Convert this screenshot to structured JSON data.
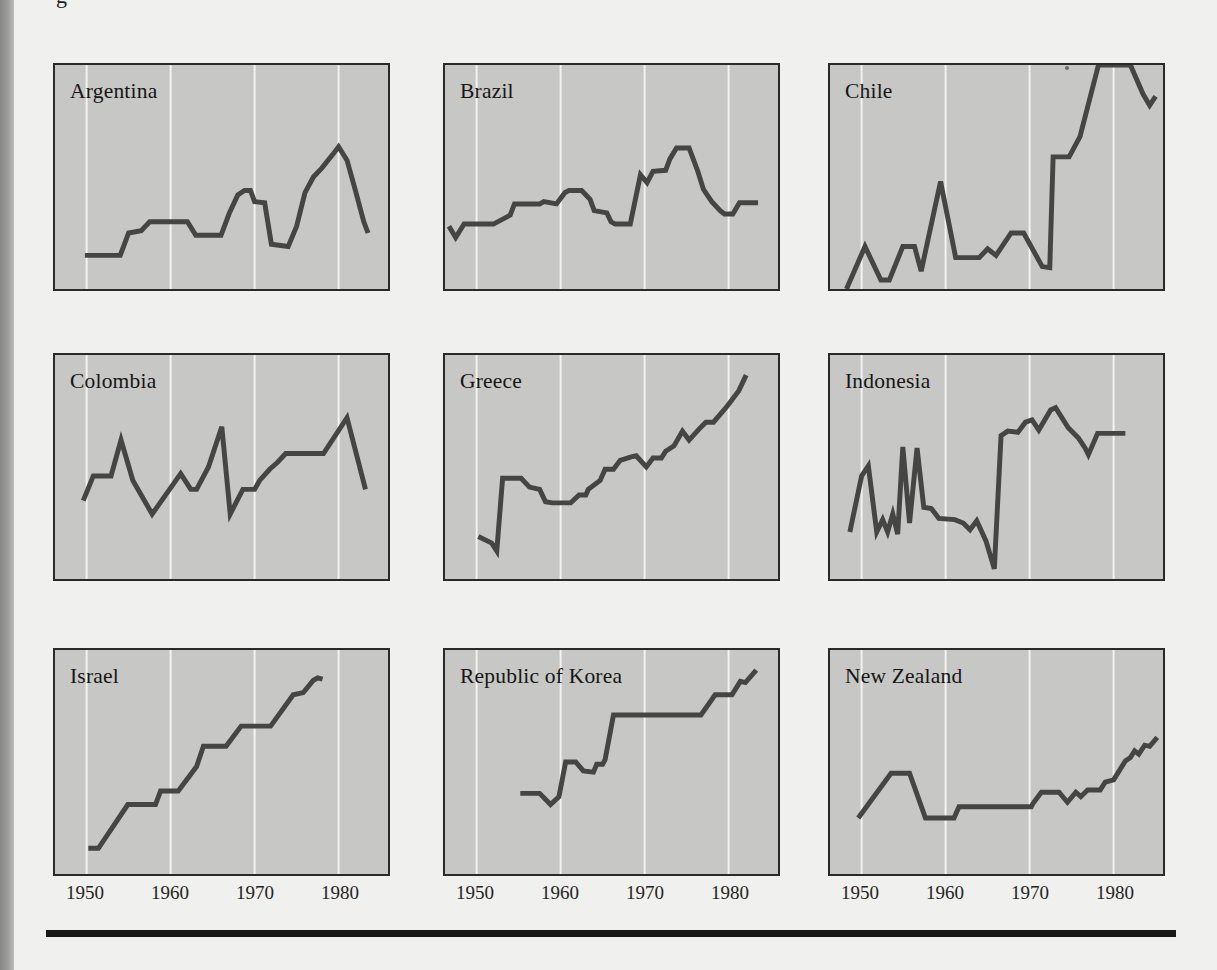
{
  "page": {
    "caption_fragment": "g",
    "background_color": "#f0f0ee",
    "gutter_color": "#9b9b99",
    "bottom_rule_color": "#191917"
  },
  "chart_data": {
    "type": "line",
    "layout": "3x3-small-multiples",
    "x_tick_labels": [
      "1950",
      "1960",
      "1970",
      "1980"
    ],
    "x_gridlines": [
      1950,
      1960,
      1970,
      1980
    ],
    "x_range": [
      1946.2,
      1985.9
    ],
    "y_range": [
      0,
      1
    ],
    "y_note": "no y-axis shown; values are relative heights 0-1 of panel",
    "grid": "vertical-only",
    "panel_fill": "#c7c7c5",
    "panel_border_color": "#2a2a28",
    "gridline_color": "#f3f3f1",
    "line_color": "#454543",
    "panels": [
      {
        "label": "Argentina",
        "points": [
          [
            1949.8,
            0.15
          ],
          [
            1954,
            0.15
          ],
          [
            1955,
            0.25
          ],
          [
            1956.5,
            0.26
          ],
          [
            1957.5,
            0.3
          ],
          [
            1958.5,
            0.3
          ],
          [
            1962,
            0.3
          ],
          [
            1963,
            0.24
          ],
          [
            1966,
            0.24
          ],
          [
            1967,
            0.34
          ],
          [
            1968,
            0.42
          ],
          [
            1968.8,
            0.44
          ],
          [
            1969.5,
            0.44
          ],
          [
            1970,
            0.39
          ],
          [
            1971.2,
            0.385
          ],
          [
            1972,
            0.2
          ],
          [
            1974,
            0.19
          ],
          [
            1975,
            0.28
          ],
          [
            1976,
            0.43
          ],
          [
            1977,
            0.5
          ],
          [
            1978,
            0.54
          ],
          [
            1979.3,
            0.6
          ],
          [
            1980,
            0.635
          ],
          [
            1981,
            0.575
          ],
          [
            1982,
            0.44
          ],
          [
            1983,
            0.3
          ],
          [
            1983.5,
            0.25
          ]
        ]
      },
      {
        "label": "Brazil",
        "points": [
          [
            1946.7,
            0.28
          ],
          [
            1947.5,
            0.23
          ],
          [
            1948.5,
            0.29
          ],
          [
            1952,
            0.29
          ],
          [
            1954,
            0.33
          ],
          [
            1954.5,
            0.38
          ],
          [
            1957.5,
            0.38
          ],
          [
            1958,
            0.39
          ],
          [
            1959.5,
            0.38
          ],
          [
            1960.5,
            0.43
          ],
          [
            1961,
            0.44
          ],
          [
            1962.5,
            0.44
          ],
          [
            1963.5,
            0.4
          ],
          [
            1964,
            0.35
          ],
          [
            1965.5,
            0.34
          ],
          [
            1966,
            0.3
          ],
          [
            1966.5,
            0.29
          ],
          [
            1968.3,
            0.29
          ],
          [
            1969.5,
            0.51
          ],
          [
            1970.3,
            0.475
          ],
          [
            1971,
            0.525
          ],
          [
            1972.5,
            0.53
          ],
          [
            1973,
            0.58
          ],
          [
            1973.8,
            0.63
          ],
          [
            1975.3,
            0.63
          ],
          [
            1976.3,
            0.53
          ],
          [
            1977,
            0.445
          ],
          [
            1978,
            0.39
          ],
          [
            1979,
            0.35
          ],
          [
            1979.5,
            0.335
          ],
          [
            1980.5,
            0.335
          ],
          [
            1981.3,
            0.385
          ],
          [
            1983.5,
            0.385
          ]
        ]
      },
      {
        "label": "Chile",
        "points": [
          [
            1948.2,
            0.0
          ],
          [
            1950.4,
            0.19
          ],
          [
            1952.3,
            0.04
          ],
          [
            1953.3,
            0.04
          ],
          [
            1954.9,
            0.19
          ],
          [
            1956.3,
            0.19
          ],
          [
            1957.1,
            0.08
          ],
          [
            1959.4,
            0.48
          ],
          [
            1961.2,
            0.14
          ],
          [
            1964,
            0.14
          ],
          [
            1965,
            0.18
          ],
          [
            1966,
            0.15
          ],
          [
            1967.8,
            0.25
          ],
          [
            1969.3,
            0.25
          ],
          [
            1971.5,
            0.1
          ],
          [
            1972.4,
            0.095
          ],
          [
            1972.8,
            0.59
          ],
          [
            1974.7,
            0.59
          ],
          [
            1976,
            0.68
          ],
          [
            1978.2,
            1.0
          ],
          [
            1982,
            1.0
          ],
          [
            1983.5,
            0.87
          ],
          [
            1984.3,
            0.82
          ],
          [
            1985,
            0.86
          ]
        ]
      },
      {
        "label": "Colombia",
        "points": [
          [
            1949.6,
            0.35
          ],
          [
            1950.8,
            0.46
          ],
          [
            1952.9,
            0.46
          ],
          [
            1954.1,
            0.62
          ],
          [
            1955.5,
            0.44
          ],
          [
            1957.8,
            0.29
          ],
          [
            1961.2,
            0.47
          ],
          [
            1962.4,
            0.4
          ],
          [
            1963.1,
            0.4
          ],
          [
            1964.5,
            0.5
          ],
          [
            1966.1,
            0.68
          ],
          [
            1967.1,
            0.29
          ],
          [
            1968.6,
            0.4
          ],
          [
            1970,
            0.4
          ],
          [
            1970.6,
            0.44
          ],
          [
            1971.8,
            0.49
          ],
          [
            1972.7,
            0.52
          ],
          [
            1973.7,
            0.56
          ],
          [
            1978.2,
            0.56
          ],
          [
            1981,
            0.72
          ],
          [
            1983.2,
            0.4
          ]
        ]
      },
      {
        "label": "Greece",
        "points": [
          [
            1950.2,
            0.19
          ],
          [
            1951.8,
            0.16
          ],
          [
            1952.4,
            0.125
          ],
          [
            1953.1,
            0.45
          ],
          [
            1955.3,
            0.45
          ],
          [
            1956.3,
            0.41
          ],
          [
            1957.5,
            0.4
          ],
          [
            1958.2,
            0.345
          ],
          [
            1959,
            0.34
          ],
          [
            1961.2,
            0.34
          ],
          [
            1962.2,
            0.375
          ],
          [
            1963,
            0.375
          ],
          [
            1963.3,
            0.4
          ],
          [
            1964.7,
            0.44
          ],
          [
            1965.3,
            0.49
          ],
          [
            1966.3,
            0.49
          ],
          [
            1967.1,
            0.53
          ],
          [
            1968.4,
            0.545
          ],
          [
            1969,
            0.55
          ],
          [
            1970.2,
            0.5
          ],
          [
            1971,
            0.54
          ],
          [
            1972,
            0.54
          ],
          [
            1972.5,
            0.57
          ],
          [
            1973.5,
            0.595
          ],
          [
            1974.5,
            0.66
          ],
          [
            1975.3,
            0.62
          ],
          [
            1976.5,
            0.67
          ],
          [
            1977.3,
            0.7
          ],
          [
            1978.2,
            0.7
          ],
          [
            1979.8,
            0.77
          ],
          [
            1981.2,
            0.84
          ],
          [
            1982.1,
            0.91
          ]
        ]
      },
      {
        "label": "Indonesia",
        "points": [
          [
            1948.6,
            0.21
          ],
          [
            1950,
            0.46
          ],
          [
            1950.8,
            0.505
          ],
          [
            1951.8,
            0.21
          ],
          [
            1952.5,
            0.265
          ],
          [
            1953.1,
            0.21
          ],
          [
            1953.7,
            0.29
          ],
          [
            1954.3,
            0.2
          ],
          [
            1954.9,
            0.59
          ],
          [
            1955.7,
            0.25
          ],
          [
            1956.6,
            0.585
          ],
          [
            1957.4,
            0.32
          ],
          [
            1958.3,
            0.315
          ],
          [
            1959.2,
            0.27
          ],
          [
            1961.1,
            0.265
          ],
          [
            1962.1,
            0.25
          ],
          [
            1962.9,
            0.22
          ],
          [
            1963.7,
            0.26
          ],
          [
            1964.8,
            0.17
          ],
          [
            1965.8,
            0.045
          ],
          [
            1966.6,
            0.64
          ],
          [
            1967.4,
            0.66
          ],
          [
            1968.6,
            0.655
          ],
          [
            1969.5,
            0.7
          ],
          [
            1970.3,
            0.71
          ],
          [
            1971.1,
            0.665
          ],
          [
            1972.5,
            0.755
          ],
          [
            1973.1,
            0.765
          ],
          [
            1974.6,
            0.675
          ],
          [
            1975.8,
            0.63
          ],
          [
            1976.6,
            0.585
          ],
          [
            1977,
            0.555
          ],
          [
            1978.1,
            0.65
          ],
          [
            1981.4,
            0.65
          ]
        ]
      },
      {
        "label": "Israel",
        "points": [
          [
            1950.2,
            0.115
          ],
          [
            1951.4,
            0.115
          ],
          [
            1954.9,
            0.31
          ],
          [
            1958.2,
            0.31
          ],
          [
            1958.8,
            0.37
          ],
          [
            1960.9,
            0.37
          ],
          [
            1963.1,
            0.48
          ],
          [
            1963.9,
            0.57
          ],
          [
            1966.6,
            0.57
          ],
          [
            1968.4,
            0.66
          ],
          [
            1971.9,
            0.66
          ],
          [
            1974.6,
            0.8
          ],
          [
            1975.8,
            0.81
          ],
          [
            1977,
            0.865
          ],
          [
            1977.5,
            0.876
          ],
          [
            1978.1,
            0.87
          ]
        ]
      },
      {
        "label": "Republic of Korea",
        "points": [
          [
            1955.2,
            0.36
          ],
          [
            1957.5,
            0.36
          ],
          [
            1958.8,
            0.31
          ],
          [
            1959.8,
            0.345
          ],
          [
            1960.6,
            0.5
          ],
          [
            1961.8,
            0.5
          ],
          [
            1962.7,
            0.46
          ],
          [
            1963.9,
            0.455
          ],
          [
            1964.3,
            0.49
          ],
          [
            1965,
            0.49
          ],
          [
            1965.3,
            0.51
          ],
          [
            1966.3,
            0.71
          ],
          [
            1976.7,
            0.71
          ],
          [
            1978.4,
            0.8
          ],
          [
            1980.4,
            0.8
          ],
          [
            1981.4,
            0.86
          ],
          [
            1982,
            0.855
          ],
          [
            1983.3,
            0.91
          ]
        ]
      },
      {
        "label": "New Zealand",
        "points": [
          [
            1949.6,
            0.25
          ],
          [
            1953.5,
            0.45
          ],
          [
            1955.7,
            0.45
          ],
          [
            1957.6,
            0.25
          ],
          [
            1961,
            0.25
          ],
          [
            1961.6,
            0.3
          ],
          [
            1970.2,
            0.3
          ],
          [
            1970.4,
            0.315
          ],
          [
            1971.4,
            0.365
          ],
          [
            1973.5,
            0.365
          ],
          [
            1974.5,
            0.32
          ],
          [
            1975.5,
            0.365
          ],
          [
            1976.1,
            0.345
          ],
          [
            1976.9,
            0.375
          ],
          [
            1978.4,
            0.375
          ],
          [
            1979,
            0.41
          ],
          [
            1980,
            0.42
          ],
          [
            1981.4,
            0.505
          ],
          [
            1982,
            0.52
          ],
          [
            1982.5,
            0.55
          ],
          [
            1983,
            0.535
          ],
          [
            1983.7,
            0.575
          ],
          [
            1984.3,
            0.57
          ],
          [
            1985.2,
            0.61
          ]
        ]
      }
    ]
  }
}
